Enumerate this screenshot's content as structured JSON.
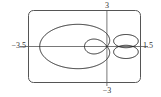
{
  "chart_data": {
    "type": "line",
    "title": "",
    "xlabel": "",
    "ylabel": "",
    "xlim": [
      -3.5,
      1.5
    ],
    "ylim": [
      -3,
      3
    ],
    "grid": false,
    "axis_labels": {
      "x_min": "−3.5",
      "x_max": "1.5",
      "y_min": "−3",
      "y_max": "3"
    },
    "series": [
      {
        "name": "polar curve",
        "description": "limacon-like polar curve with large outer loop reaching x=-3 and small inner loops near x between 0 and 1.4",
        "key_points": [
          {
            "x": -3.0,
            "y": 0
          },
          {
            "x": -1.0,
            "y": 2.7
          },
          {
            "x": -1.0,
            "y": -2.7
          },
          {
            "x": 1.0,
            "y": 0
          },
          {
            "x": 1.4,
            "y": 0.5
          },
          {
            "x": 1.4,
            "y": -0.5
          },
          {
            "x": 0.0,
            "y": 0
          }
        ]
      }
    ]
  }
}
